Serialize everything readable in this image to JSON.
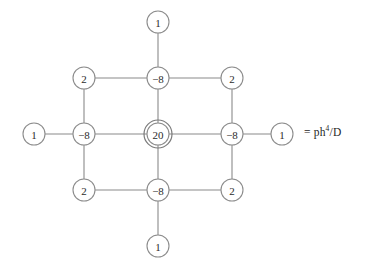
{
  "figure": {
    "type": "finite-difference-stencil",
    "title": "",
    "background_color": "#ffffff",
    "line_color": "#8a8a8a",
    "text_color": "#2b2b2b"
  },
  "legend": {
    "equals_sign": "=",
    "base": "ph",
    "exponent": "4",
    "divider_and_denominator": "/D",
    "full_text": "= ph4/D"
  },
  "stencil": {
    "center": {
      "x": 158,
      "y": 134
    },
    "spacing_x": 74,
    "spacing_y": 56,
    "node_radius": 11,
    "center_outer_radius": 14,
    "nodes": [
      {
        "id": "top-outer",
        "label": "1",
        "x": 158,
        "y": 22,
        "radius": 11,
        "double": false
      },
      {
        "id": "top-left",
        "label": "2",
        "x": 84,
        "y": 78,
        "radius": 11,
        "double": false
      },
      {
        "id": "top-center",
        "label": "−8",
        "x": 158,
        "y": 78,
        "radius": 11,
        "double": false
      },
      {
        "id": "top-right",
        "label": "2",
        "x": 232,
        "y": 78,
        "radius": 11,
        "double": false
      },
      {
        "id": "left-outer",
        "label": "1",
        "x": 34,
        "y": 134,
        "radius": 11,
        "double": false
      },
      {
        "id": "mid-left",
        "label": "−8",
        "x": 84,
        "y": 134,
        "radius": 11,
        "double": false
      },
      {
        "id": "center",
        "label": "20",
        "x": 158,
        "y": 134,
        "radius": 11,
        "double": true
      },
      {
        "id": "mid-right",
        "label": "−8",
        "x": 232,
        "y": 134,
        "radius": 11,
        "double": false
      },
      {
        "id": "right-outer",
        "label": "1",
        "x": 282,
        "y": 134,
        "radius": 11,
        "double": false
      },
      {
        "id": "bottom-left",
        "label": "2",
        "x": 84,
        "y": 190,
        "radius": 11,
        "double": false
      },
      {
        "id": "bottom-center",
        "label": "−8",
        "x": 158,
        "y": 190,
        "radius": 11,
        "double": false
      },
      {
        "id": "bottom-right",
        "label": "2",
        "x": 232,
        "y": 190,
        "radius": 11,
        "double": false
      },
      {
        "id": "bottom-outer",
        "label": "1",
        "x": 158,
        "y": 246,
        "radius": 11,
        "double": false
      }
    ],
    "edges": [
      {
        "from": "top-outer",
        "to": "top-center"
      },
      {
        "from": "top-left",
        "to": "top-center"
      },
      {
        "from": "top-center",
        "to": "top-right"
      },
      {
        "from": "top-left",
        "to": "mid-left"
      },
      {
        "from": "top-center",
        "to": "center"
      },
      {
        "from": "top-right",
        "to": "mid-right"
      },
      {
        "from": "left-outer",
        "to": "mid-left"
      },
      {
        "from": "mid-left",
        "to": "center"
      },
      {
        "from": "center",
        "to": "mid-right"
      },
      {
        "from": "mid-right",
        "to": "right-outer"
      },
      {
        "from": "mid-left",
        "to": "bottom-left"
      },
      {
        "from": "center",
        "to": "bottom-center"
      },
      {
        "from": "mid-right",
        "to": "bottom-right"
      },
      {
        "from": "bottom-left",
        "to": "bottom-center"
      },
      {
        "from": "bottom-center",
        "to": "bottom-right"
      },
      {
        "from": "bottom-center",
        "to": "bottom-outer"
      }
    ]
  },
  "chart_data": {
    "type": "heatmap",
    "xlabel": "",
    "ylabel": "",
    "categories": [
      "-2h",
      "-h",
      "0",
      "h",
      "2h"
    ],
    "stencil_weights": [
      [
        null,
        null,
        1,
        null,
        null
      ],
      [
        null,
        2,
        -8,
        2,
        null
      ],
      [
        1,
        -8,
        20,
        -8,
        1
      ],
      [
        null,
        2,
        -8,
        2,
        null
      ],
      [
        null,
        null,
        1,
        null,
        null
      ]
    ],
    "annotations": [
      "= ph4/D"
    ],
    "grid": false,
    "legend_position": "right"
  }
}
